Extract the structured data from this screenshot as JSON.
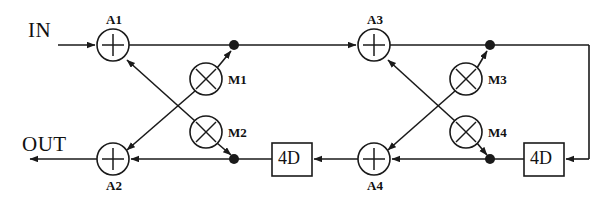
{
  "diagram": {
    "stroke_color": "#1a1a1a",
    "background_color": "#ffffff",
    "ports": {
      "input_label": "IN",
      "output_label": "OUT"
    },
    "adders": [
      {
        "id": "A1",
        "label": "A1",
        "symbol": "+",
        "cx": 113,
        "cy": 45,
        "r": 16,
        "label_pos": "above"
      },
      {
        "id": "A2",
        "label": "A2",
        "symbol": "+",
        "cx": 113,
        "cy": 159,
        "r": 16,
        "label_pos": "below"
      },
      {
        "id": "A3",
        "label": "A3",
        "symbol": "+",
        "cx": 374,
        "cy": 45,
        "r": 16,
        "label_pos": "above"
      },
      {
        "id": "A4",
        "label": "A4",
        "symbol": "+",
        "cx": 374,
        "cy": 159,
        "r": 16,
        "label_pos": "below"
      }
    ],
    "multipliers": [
      {
        "id": "M1",
        "label": "M1",
        "symbol": "x",
        "cx": 206,
        "cy": 79,
        "r": 16,
        "label_pos": "right"
      },
      {
        "id": "M2",
        "label": "M2",
        "symbol": "x",
        "cx": 206,
        "cy": 132,
        "r": 16,
        "label_pos": "right"
      },
      {
        "id": "M3",
        "label": "M3",
        "symbol": "x",
        "cx": 466,
        "cy": 79,
        "r": 16,
        "label_pos": "right"
      },
      {
        "id": "M4",
        "label": "M4",
        "symbol": "x",
        "cx": 466,
        "cy": 132,
        "r": 16,
        "label_pos": "right"
      }
    ],
    "delay_blocks": [
      {
        "id": "D1",
        "label": "4D",
        "x": 272,
        "y": 143,
        "w": 40,
        "h": 33
      },
      {
        "id": "D2",
        "label": "4D",
        "x": 524,
        "y": 143,
        "w": 40,
        "h": 33
      }
    ],
    "junctions": [
      {
        "id": "J1",
        "cx": 234,
        "cy": 45,
        "r": 5
      },
      {
        "id": "J2",
        "cx": 234,
        "cy": 159,
        "r": 5
      },
      {
        "id": "J3",
        "cx": 490,
        "cy": 45,
        "r": 5
      },
      {
        "id": "J4",
        "cx": 490,
        "cy": 159,
        "r": 5
      }
    ],
    "connections": [
      {
        "from": "IN",
        "to": "A1"
      },
      {
        "from": "A1",
        "to": "J1"
      },
      {
        "from": "J1",
        "to": "A3"
      },
      {
        "from": "J1",
        "to": "M1"
      },
      {
        "from": "M1",
        "to": "A2"
      },
      {
        "from": "J2",
        "to": "M2"
      },
      {
        "from": "M2",
        "to": "A1"
      },
      {
        "from": "D1",
        "to": "J2"
      },
      {
        "from": "J2",
        "to": "A2"
      },
      {
        "from": "A2",
        "to": "OUT"
      },
      {
        "from": "A3",
        "to": "J3"
      },
      {
        "from": "J3",
        "to": "M3"
      },
      {
        "from": "M3",
        "to": "A4"
      },
      {
        "from": "J4",
        "to": "M4"
      },
      {
        "from": "M4",
        "to": "A3"
      },
      {
        "from": "D2",
        "to": "J4"
      },
      {
        "from": "J4",
        "to": "A4"
      },
      {
        "from": "A4",
        "to": "D1"
      },
      {
        "from": "J3",
        "to": "D2"
      }
    ]
  }
}
